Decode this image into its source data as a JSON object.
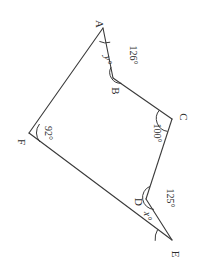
{
  "figure": {
    "type": "geometry-diagram",
    "shape": "hexagon",
    "background_color": "#ffffff",
    "stroke_color": "#3a3a3a",
    "vertices": [
      {
        "name": "A",
        "label": "A",
        "x": 103,
        "y": 28,
        "label_x": 96,
        "label_y": 24
      },
      {
        "name": "B",
        "label": "B",
        "x": 113,
        "y": 78,
        "label_x": 110,
        "label_y": 90
      },
      {
        "name": "C",
        "label": "C",
        "x": 172,
        "y": 119,
        "label_x": 178,
        "label_y": 117
      },
      {
        "name": "D",
        "label": "D",
        "x": 146,
        "y": 199,
        "label_x": 134,
        "label_y": 203
      },
      {
        "name": "E",
        "label": "E",
        "x": 172,
        "y": 240,
        "label_x": 170,
        "label_y": 253
      },
      {
        "name": "F",
        "label": "F",
        "x": 29,
        "y": 133,
        "label_x": 17,
        "label_y": 141
      }
    ],
    "edges": [
      {
        "name": "edge-AB",
        "from": "A",
        "to": "B"
      },
      {
        "name": "edge-BC",
        "from": "B",
        "to": "C"
      },
      {
        "name": "edge-CD",
        "from": "C",
        "to": "D"
      },
      {
        "name": "edge-DE",
        "from": "D",
        "to": "E"
      },
      {
        "name": "edge-EF",
        "from": "E",
        "to": "F"
      },
      {
        "name": "edge-FA",
        "from": "F",
        "to": "A"
      }
    ],
    "angles": [
      {
        "name": "angle-at-B",
        "vertex": "B",
        "text": "126°",
        "known": true,
        "rotated": true,
        "label_x": 127,
        "label_y": 55
      },
      {
        "name": "angle-at-C",
        "vertex": "C",
        "text": "100°",
        "known": true,
        "rotated": true,
        "label_x": 157,
        "label_y": 133
      },
      {
        "name": "angle-at-D",
        "vertex": "D",
        "text": "125°",
        "known": true,
        "rotated": true,
        "label_x": 164,
        "label_y": 196
      },
      {
        "name": "angle-at-F",
        "vertex": "F",
        "text": "92°",
        "known": true,
        "rotated": true,
        "label_x": 45,
        "label_y": 131
      },
      {
        "name": "angle-at-A",
        "vertex": "A",
        "text": "y°",
        "known": false,
        "rotated": true,
        "label_x": 105,
        "label_y": 60
      },
      {
        "name": "angle-at-E",
        "vertex": "E",
        "text": "x°",
        "known": false,
        "rotated": true,
        "label_x": 142,
        "label_y": 215
      }
    ]
  }
}
